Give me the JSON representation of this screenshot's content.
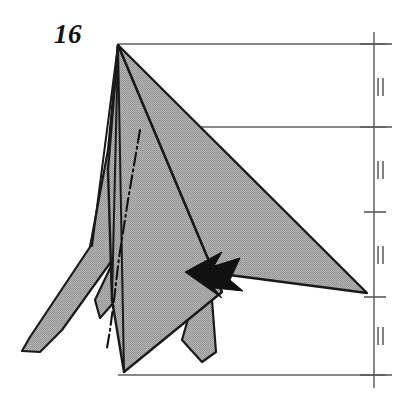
{
  "figure": {
    "kind": "origami-folding-diagram",
    "step_label": "16",
    "background_color": "#ffffff",
    "paper_fill_color": "#a8a8a8",
    "paper_fill_pattern": "halftone-dot",
    "outline_color": "#1a1a1a",
    "reference_line_color": "#5a5a5a",
    "arrow_color": "#111111"
  },
  "canvas": {
    "width": 413,
    "height": 396
  },
  "shapes": {
    "main_triangle": {
      "name": "large-right-flap",
      "description": "Large shaded triangle from apex down-right to far right vertex",
      "points": "118,45 367,293 130,262"
    },
    "left_outer_flap": {
      "name": "left-outer-point",
      "description": "Long tapering point extending to lower left",
      "points": "118,45 108,150 90,247 30,337 22,351 40,352 62,330 118,252"
    },
    "left_inner_flap": {
      "name": "left-inner-point",
      "description": "Second tapering point behind the outer left point",
      "points": "118,45 110,180 113,262 95,300 100,318 116,300 122,200"
    },
    "center_body": {
      "name": "center-body-panel",
      "description": "Central kite panel from apex down to bottom point",
      "points": "118,45 222,292 124,372 112,300 108,170"
    },
    "lower_right_flap": {
      "name": "lower-right-small-point",
      "description": "Narrow flap angled down-right near the bottom",
      "points": "190,312 212,300 216,352 202,362 182,340"
    }
  },
  "fold_lines": {
    "apex_rays": [
      {
        "name": "apex-ray-1",
        "x1": 118,
        "y1": 45,
        "x2": 92,
        "y2": 246
      },
      {
        "name": "apex-ray-2",
        "x1": 118,
        "y1": 45,
        "x2": 112,
        "y2": 300
      },
      {
        "name": "apex-ray-3",
        "x1": 118,
        "y1": 45,
        "x2": 124,
        "y2": 372
      },
      {
        "name": "apex-ray-4",
        "x1": 118,
        "y1": 45,
        "x2": 222,
        "y2": 292
      }
    ],
    "mountain_valley_chain": {
      "name": "axis-chain-line",
      "style": "dash-dot",
      "points": "140,130 128,200 119,258 114,300 110,330 107,348"
    }
  },
  "reference_lines": {
    "top": {
      "name": "top-reference-line",
      "x1": 118,
      "y1": 44,
      "x2": 386,
      "y2": 44
    },
    "middle": {
      "name": "middle-reference-line",
      "x1": 124,
      "y1": 127,
      "x2": 386,
      "y2": 127
    },
    "bottom": {
      "name": "bottom-reference-line",
      "x1": 118,
      "y1": 375,
      "x2": 386,
      "y2": 375
    }
  },
  "measurement_scale": {
    "name": "equal-division-scale",
    "axis": {
      "x": 374,
      "y_top": 32,
      "y_bottom": 388
    },
    "ticks": [
      {
        "name": "scale-tick-1",
        "y": 44,
        "x1": 360,
        "x2": 392,
        "length": "long"
      },
      {
        "name": "scale-tick-2",
        "y": 127,
        "x1": 360,
        "x2": 392,
        "length": "long"
      },
      {
        "name": "scale-tick-3",
        "y": 212,
        "x1": 364,
        "x2": 386,
        "length": "short"
      },
      {
        "name": "scale-tick-4",
        "y": 297,
        "x1": 364,
        "x2": 386,
        "length": "short"
      },
      {
        "name": "scale-tick-5",
        "y": 375,
        "x1": 360,
        "x2": 392,
        "length": "long"
      }
    ],
    "equal_marks": [
      {
        "name": "equal-mark-1",
        "y": 87,
        "x": 378
      },
      {
        "name": "equal-mark-2",
        "y": 170,
        "x": 378
      },
      {
        "name": "equal-mark-3",
        "y": 255,
        "x": 378
      },
      {
        "name": "equal-mark-4",
        "y": 336,
        "x": 378
      }
    ],
    "equal_mark_glyph": "||",
    "segments_count": 4,
    "note": "four equal divisions marked by double-stroke equality ticks"
  },
  "arrow": {
    "name": "fold-arrow",
    "direction": "left",
    "description": "Solid filled origami fold arrow pointing left with notched swallow tail",
    "points": "185,272 222,252 214,266 240,258 230,280 243,291 214,288 222,298"
  }
}
